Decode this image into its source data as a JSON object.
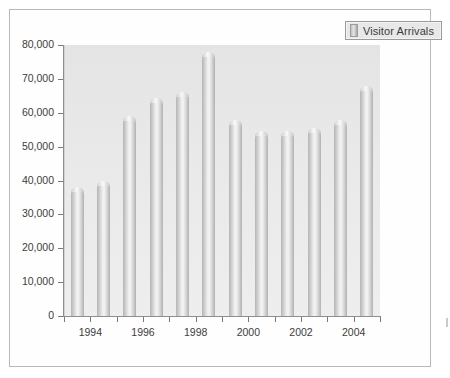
{
  "legend": {
    "label": "Visitor Arrivals",
    "swatch_color": "#c0c0c0",
    "position": "top-right"
  },
  "chart_data": {
    "type": "bar",
    "title": "",
    "xlabel": "",
    "ylabel": "",
    "categories": [
      "1993",
      "1994",
      "1995",
      "1996",
      "1997",
      "1998",
      "1999",
      "2000",
      "2001",
      "2002",
      "2003",
      "2004"
    ],
    "series": [
      {
        "name": "Visitor Arrivals",
        "values": [
          38000,
          40000,
          59000,
          64500,
          66000,
          78000,
          58000,
          54500,
          54500,
          55500,
          58000,
          68000
        ]
      }
    ],
    "values": [
      38000,
      40000,
      59000,
      64500,
      66000,
      78000,
      58000,
      54500,
      54500,
      55500,
      58000,
      68000
    ],
    "ylim": [
      0,
      80000
    ],
    "ytick_labels": [
      "80,000",
      "70,000",
      "60,000",
      "50,000",
      "40,000",
      "30,000",
      "20,000",
      "10,000",
      "0"
    ],
    "ytick_values": [
      80000,
      70000,
      60000,
      50000,
      40000,
      30000,
      20000,
      10000,
      0
    ],
    "xtick_labels": [
      "1994",
      "1996",
      "1998",
      "2000",
      "2002",
      "2004"
    ],
    "xtick_values": [
      1994,
      1996,
      1998,
      2000,
      2002,
      2004
    ],
    "grid": false,
    "legend_position": "top-right",
    "bar_style": "3d-cylinder-grayscale",
    "plot_background": "#e9e9e9"
  }
}
